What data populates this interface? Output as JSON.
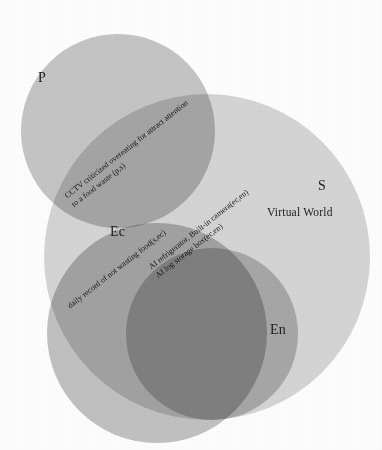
{
  "figure": {
    "type": "euler-diagram",
    "background_color": "#fefefe"
  },
  "sets": [
    {
      "key": "P",
      "key_label": "P",
      "name_label": "",
      "fill": "#c6c6c6",
      "key_x": 38,
      "key_y": 70,
      "cx": 118,
      "cy": 131,
      "r": 97
    },
    {
      "key": "S",
      "key_label": "S",
      "name_label": "Virtual World",
      "fill": "#d6d6d6",
      "key_x": 318,
      "key_y": 178,
      "name_x": 267,
      "name_y": 206,
      "cx": 207,
      "cy": 257,
      "r": 163
    },
    {
      "key": "Ec",
      "key_label": "Ec",
      "name_label": "",
      "fill": "#c2c2c2",
      "key_x": 110,
      "key_y": 224,
      "cx": 157,
      "cy": 333,
      "r": 110
    },
    {
      "key": "En",
      "key_label": "En",
      "name_label": "",
      "fill": "#c8c8c8",
      "key_x": 270,
      "key_y": 322,
      "cx": 212,
      "cy": 334,
      "r": 86
    }
  ],
  "annotations": [
    {
      "id": "p-s-overlap",
      "region": "P ∩ S",
      "lines": [
        "CCTV criticized overeating for attract attention",
        "to a food waste (p,s)"
      ],
      "x": 63,
      "y": 193,
      "rotation_deg": -38
    },
    {
      "id": "ec-en-overlap",
      "region": "Ec ∩ En",
      "lines": [
        "AI refrigerator, Built-in camera(ec,en)",
        "AI log storage box(ec,en)"
      ],
      "x": 147,
      "y": 264,
      "rotation_deg": -38
    },
    {
      "id": "s-ec-overlap",
      "region": "S ∩ Ec",
      "lines": [
        "daily record of not wasting food(s,ec)"
      ],
      "x": 66,
      "y": 303,
      "rotation_deg": -38
    }
  ]
}
